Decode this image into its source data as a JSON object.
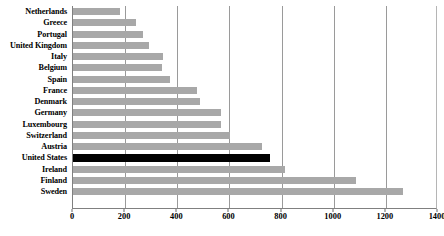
{
  "chart_data": {
    "type": "bar",
    "orientation": "horizontal",
    "title": "",
    "subtitle": "",
    "xlabel": "",
    "ylabel": "",
    "xlim": [
      0,
      1400
    ],
    "xticks": [
      0,
      200,
      400,
      600,
      800,
      1000,
      1200,
      1400
    ],
    "grid": true,
    "legend": false,
    "categories": [
      "Netherlands",
      "Greece",
      "Portugal",
      "United Kingdom",
      "Italy",
      "Belgium",
      "Spain",
      "France",
      "Denmark",
      "Germany",
      "Luxembourg",
      "Switzerland",
      "Austria",
      "United States",
      "Ireland",
      "Finland",
      "Sweden"
    ],
    "values": [
      180,
      243,
      270,
      292,
      345,
      342,
      373,
      477,
      488,
      566,
      566,
      602,
      726,
      756,
      812,
      1086,
      1265
    ],
    "highlight_category": "United States",
    "colors": {
      "bar": "#a8a8a8",
      "highlight_bar": "#000000",
      "gridline": "#9a9a9a",
      "axis": "#808080",
      "background": "#ffffff",
      "text": "#000000"
    }
  }
}
